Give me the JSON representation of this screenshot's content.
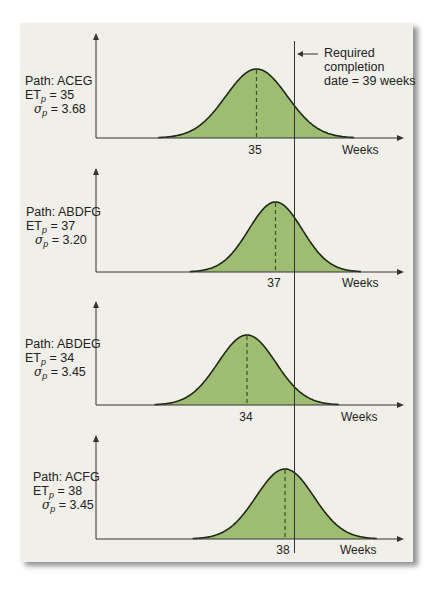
{
  "annotation": {
    "line1": "Required",
    "line2": "completion",
    "line3": "date = 39 weeks",
    "required_weeks": 39
  },
  "colors": {
    "fill": "#9fbd72",
    "curve": "#1e2a14",
    "dash": "#3a5424",
    "axis": "#333333",
    "panel": "#f1efe9"
  },
  "charts": [
    {
      "path_label": "Path: ACEG",
      "et_label": "ET",
      "et_sub": "p",
      "et_value": "= 35",
      "sigma_sub": "p",
      "sigma_value": "= 3.68",
      "mean_tick": "35",
      "x_label": "Weeks"
    },
    {
      "path_label": "Path: ABDFG",
      "et_label": "ET",
      "et_sub": "p",
      "et_value": "= 37",
      "sigma_sub": "p",
      "sigma_value": "= 3.20",
      "mean_tick": "37",
      "x_label": "Weeks"
    },
    {
      "path_label": "Path: ABDEG",
      "et_label": "ET",
      "et_sub": "p",
      "et_value": "= 34",
      "sigma_sub": "p",
      "sigma_value": "= 3.45",
      "mean_tick": "34",
      "x_label": "Weeks"
    },
    {
      "path_label": "Path: ACFG",
      "et_label": "ET",
      "et_sub": "p",
      "et_value": "= 38",
      "sigma_sub": "p",
      "sigma_value": "= 3.45",
      "mean_tick": "38",
      "x_label": "Weeks"
    }
  ],
  "chart_data": {
    "type": "area",
    "title": "",
    "xlabel": "Weeks",
    "ylabel": "",
    "grid": false,
    "annotation": "Required completion date = 39 weeks",
    "reference_line_x": 39,
    "series": [
      {
        "name": "Path: ACEG",
        "distribution": "normal",
        "mean": 35,
        "std": 3.68
      },
      {
        "name": "Path: ABDFG",
        "distribution": "normal",
        "mean": 37,
        "std": 3.2
      },
      {
        "name": "Path: ABDEG",
        "distribution": "normal",
        "mean": 34,
        "std": 3.45
      },
      {
        "name": "Path: ACFG",
        "distribution": "normal",
        "mean": 38,
        "std": 3.45
      }
    ]
  }
}
